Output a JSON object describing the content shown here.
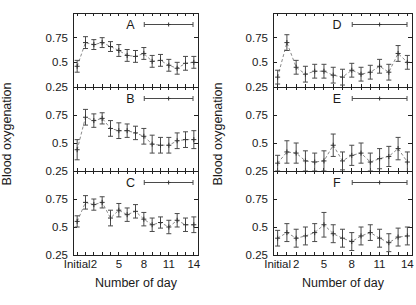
{
  "figure": {
    "ylabel": "Blood oxygenation",
    "xlabel": "Number of day",
    "background_color": "#ffffff",
    "axis_color": "#222222",
    "line_color": "#8a8a8a"
  },
  "chart_data": {
    "type": "line",
    "layout": "2 columns x 3 vertically stacked panels, shared axes",
    "x": [
      0,
      1,
      2,
      3,
      4,
      5,
      6,
      7,
      8,
      9,
      10,
      11,
      12,
      13,
      14
    ],
    "x_tick_labels": [
      {
        "pos": 0,
        "label": "Initial"
      },
      {
        "pos": 2,
        "label": "2"
      },
      {
        "pos": 5,
        "label": "5"
      },
      {
        "pos": 8,
        "label": "8"
      },
      {
        "pos": 11,
        "label": "11"
      },
      {
        "pos": 14,
        "label": "14"
      }
    ],
    "xlabel": "Number of day",
    "ylabel": "Blood oxygenation",
    "xlim": [
      -0.5,
      14.5
    ],
    "ylim": [
      0.25,
      1.0
    ],
    "y_ticks": [
      0.25,
      0.5,
      0.75,
      1.0
    ],
    "y_tick_labeled": [
      {
        "value": 0.25,
        "label": "0.25"
      },
      {
        "value": 0.5,
        "label": "0.5"
      },
      {
        "value": 0.75,
        "label": "0.75"
      }
    ],
    "grid": false,
    "legend_position": "top-right inside each panel",
    "marker": "plus with capped error bars",
    "line_style": "dashed",
    "series": [
      {
        "name": "A",
        "column": 0,
        "row": 0,
        "values": [
          0.46,
          0.7,
          0.68,
          0.7,
          0.66,
          0.62,
          0.57,
          0.56,
          0.59,
          0.51,
          0.52,
          0.47,
          0.44,
          0.49,
          0.5
        ],
        "errors": [
          0.06,
          0.06,
          0.05,
          0.05,
          0.05,
          0.06,
          0.06,
          0.06,
          0.06,
          0.06,
          0.06,
          0.06,
          0.06,
          0.07,
          0.06
        ]
      },
      {
        "name": "B",
        "column": 0,
        "row": 1,
        "values": [
          0.44,
          0.73,
          0.7,
          0.72,
          0.63,
          0.61,
          0.61,
          0.59,
          0.56,
          0.49,
          0.48,
          0.48,
          0.52,
          0.53,
          0.53
        ],
        "errors": [
          0.09,
          0.07,
          0.06,
          0.05,
          0.07,
          0.07,
          0.06,
          0.06,
          0.07,
          0.08,
          0.07,
          0.07,
          0.07,
          0.07,
          0.08
        ]
      },
      {
        "name": "C",
        "column": 0,
        "row": 2,
        "values": [
          0.55,
          0.72,
          0.7,
          0.72,
          0.58,
          0.65,
          0.61,
          0.64,
          0.57,
          0.52,
          0.54,
          0.5,
          0.56,
          0.52,
          0.52
        ],
        "errors": [
          0.05,
          0.06,
          0.05,
          0.05,
          0.07,
          0.06,
          0.06,
          0.06,
          0.06,
          0.06,
          0.05,
          0.06,
          0.06,
          0.06,
          0.07
        ]
      },
      {
        "name": "D",
        "column": 1,
        "row": 0,
        "values": [
          0.35,
          0.7,
          0.45,
          0.38,
          0.41,
          0.41,
          0.37,
          0.35,
          0.42,
          0.38,
          0.4,
          0.46,
          0.4,
          0.59,
          0.5
        ],
        "errors": [
          0.07,
          0.08,
          0.07,
          0.08,
          0.07,
          0.07,
          0.08,
          0.08,
          0.07,
          0.07,
          0.07,
          0.07,
          0.08,
          0.08,
          0.07
        ]
      },
      {
        "name": "E",
        "column": 1,
        "row": 1,
        "values": [
          0.32,
          0.42,
          0.41,
          0.34,
          0.33,
          0.34,
          0.48,
          0.34,
          0.39,
          0.41,
          0.33,
          0.36,
          0.38,
          0.45,
          0.33
        ],
        "errors": [
          0.07,
          0.1,
          0.09,
          0.09,
          0.08,
          0.09,
          0.1,
          0.08,
          0.09,
          0.09,
          0.08,
          0.09,
          0.09,
          0.1,
          0.09
        ]
      },
      {
        "name": "F",
        "column": 1,
        "row": 2,
        "values": [
          0.4,
          0.45,
          0.4,
          0.42,
          0.45,
          0.52,
          0.44,
          0.4,
          0.37,
          0.42,
          0.45,
          0.4,
          0.36,
          0.41,
          0.42
        ],
        "errors": [
          0.07,
          0.08,
          0.08,
          0.08,
          0.08,
          0.11,
          0.08,
          0.08,
          0.08,
          0.08,
          0.07,
          0.08,
          0.08,
          0.08,
          0.08
        ]
      }
    ]
  }
}
